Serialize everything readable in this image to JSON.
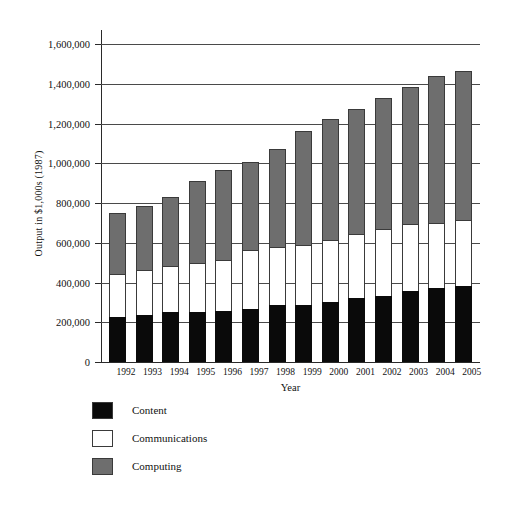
{
  "chart_data": {
    "type": "bar",
    "subtype": "stacked-bar",
    "title": "",
    "xlabel": "Year",
    "ylabel": "Output in $1,000s (1987)",
    "categories": [
      "1992",
      "1993",
      "1994",
      "1995",
      "1996",
      "1997",
      "1998",
      "1999",
      "2000",
      "2001",
      "2002",
      "2003",
      "2004",
      "2005"
    ],
    "series": [
      {
        "name": "Content",
        "color": "#0a0a0a",
        "values": [
          225000,
          237000,
          252000,
          253000,
          257000,
          265000,
          285000,
          288000,
          302000,
          322000,
          333000,
          355000,
          374000,
          384000
        ]
      },
      {
        "name": "Communications",
        "color": "#ffffff",
        "values": [
          220000,
          227000,
          230000,
          245000,
          255000,
          300000,
          292000,
          300000,
          312000,
          322000,
          337000,
          338000,
          325000,
          330000
        ]
      },
      {
        "name": "Computing",
        "color": "#6e6e6e",
        "values": [
          305000,
          323000,
          348000,
          412000,
          455000,
          440000,
          495000,
          575000,
          608000,
          628000,
          658000,
          690000,
          742000,
          752000
        ]
      }
    ],
    "totals": [
      750000,
      787000,
      830000,
      910000,
      967000,
      1005000,
      1072000,
      1163000,
      1222000,
      1272000,
      1328000,
      1383000,
      1441000,
      1466000
    ],
    "ylim": [
      0,
      1600000
    ],
    "ytick_step": 200000,
    "yticks": [
      "0",
      "200,000",
      "400,000",
      "600,000",
      "800,000",
      "1,000,000",
      "1,200,000",
      "1,400,000",
      "1,600,000"
    ],
    "grid": true,
    "legend_position": "bottom-left",
    "legend": [
      "Content",
      "Communications",
      "Computing"
    ]
  },
  "axes": {
    "y_title": "Output in $1,000s (1987)",
    "x_title": "Year"
  },
  "legend": {
    "items": [
      {
        "label": "Content",
        "swatch": "legend-swatch-content"
      },
      {
        "label": "Communications",
        "swatch": "legend-swatch-communications"
      },
      {
        "label": "Computing",
        "swatch": "legend-swatch-computing"
      }
    ]
  }
}
